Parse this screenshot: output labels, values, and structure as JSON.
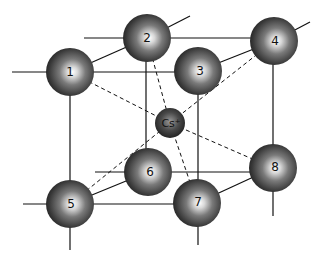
{
  "diagram": {
    "central_ion": {
      "label": "Cs+",
      "display": "Cs⁺",
      "x": 170,
      "y": 123,
      "r": 15
    },
    "corner_atoms": [
      {
        "id": 1,
        "label": "1",
        "x": 70,
        "y": 72,
        "r": 24
      },
      {
        "id": 2,
        "label": "2",
        "x": 147,
        "y": 38,
        "r": 24
      },
      {
        "id": 3,
        "label": "3",
        "x": 198,
        "y": 71,
        "r": 24
      },
      {
        "id": 4,
        "label": "4",
        "x": 274,
        "y": 41,
        "r": 24
      },
      {
        "id": 5,
        "label": "5",
        "x": 70,
        "y": 204,
        "r": 24
      },
      {
        "id": 6,
        "label": "6",
        "x": 148,
        "y": 172,
        "r": 24
      },
      {
        "id": 7,
        "label": "7",
        "x": 197,
        "y": 203,
        "r": 24
      },
      {
        "id": 8,
        "label": "8",
        "x": 273,
        "y": 168,
        "r": 24
      }
    ],
    "colors": {
      "line": "#111111",
      "sphere_dark": "#1a1a1a",
      "sphere_mid": "#6a6a6a",
      "sphere_highlight": "#ffffff"
    }
  }
}
